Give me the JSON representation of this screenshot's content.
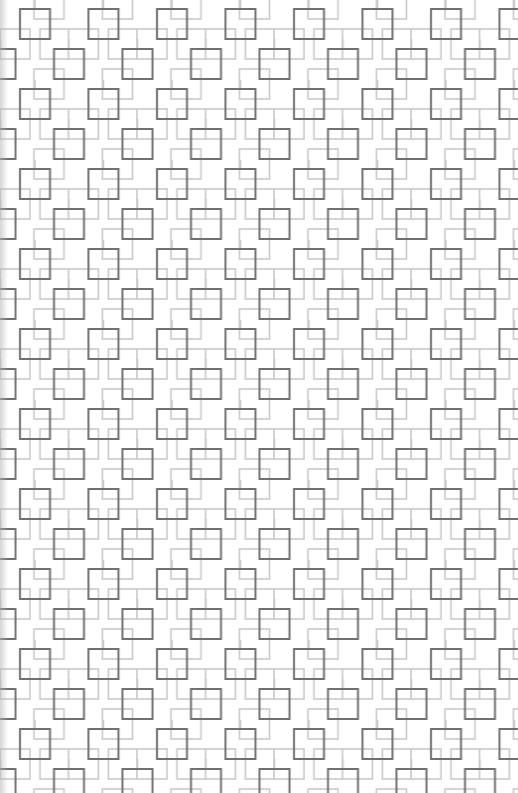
{
  "pattern": {
    "name": "interlocking-squares",
    "background_color": "#ffffff",
    "dark_stroke_color": "#6e6e6e",
    "light_stroke_color": "#c8c8c8",
    "tile_width": 68.5,
    "tile_height": 80,
    "square_size": 30
  }
}
